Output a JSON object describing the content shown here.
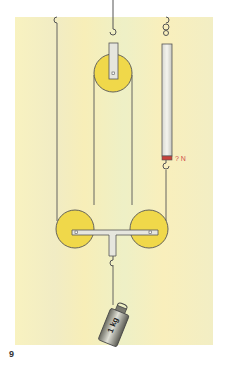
{
  "figure": {
    "number": "9",
    "spring_scale_label": "? N",
    "weight_label": "1 kg",
    "colors": {
      "background": "#f6f0b8",
      "pulley": "#f0d84a",
      "frame": "#e6e6de",
      "scale_marker": "#c8423a",
      "label": "#d0504a",
      "rope": "#555555"
    }
  }
}
